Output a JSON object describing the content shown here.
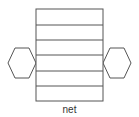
{
  "caption": "net",
  "colors": {
    "stroke": "#555555",
    "fill": "#ffffff"
  },
  "diagram": {
    "type": "hexagonal-prism-net",
    "faces": {
      "rectangles": 6,
      "hexagons": 2
    }
  }
}
